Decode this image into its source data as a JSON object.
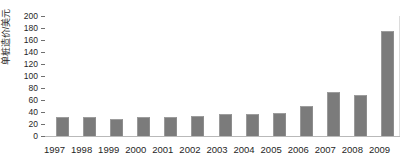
{
  "chart_data": {
    "type": "bar",
    "title": "",
    "subtitle": "",
    "xlabel": "",
    "ylabel": "单桩造价/美元",
    "categories": [
      "1997",
      "1998",
      "1999",
      "2000",
      "2001",
      "2002",
      "2003",
      "2004",
      "2005",
      "2006",
      "2007",
      "2008",
      "2009"
    ],
    "values": [
      32,
      31,
      29,
      31,
      32,
      34,
      36,
      36,
      38,
      50,
      74,
      69,
      175
    ],
    "ylim": [
      0,
      200
    ],
    "ytick_values": [
      0,
      20,
      40,
      60,
      80,
      100,
      120,
      140,
      160,
      180,
      200
    ],
    "ytick_labels": [
      "0",
      "20",
      "40",
      "60",
      "80",
      "100",
      "120",
      "140",
      "160",
      "180",
      "200"
    ],
    "grid": false,
    "legend": false,
    "legend_position": "none",
    "series": [
      {
        "name": "单桩造价",
        "values": [
          32,
          31,
          29,
          31,
          32,
          34,
          36,
          36,
          38,
          50,
          74,
          69,
          175
        ],
        "color": "#7b7b7b"
      }
    ],
    "annotations": []
  },
  "colors": {
    "bar_fill": "#7b7b7b",
    "bar_edge": "#9a9a9a",
    "axis_line": "#b9b9b9",
    "tick_mark": "#6f6f6f",
    "text": "#1f1f1f",
    "background": "#ffffff"
  }
}
